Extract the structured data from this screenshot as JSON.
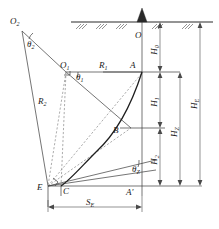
{
  "figure": {
    "type": "geotechnical-slip-surface-diagram",
    "background_color": "#ffffff",
    "line_color": "#3a3a3a",
    "curve_color": "#1f1f1f",
    "dashed_color": "#8a8a8a"
  },
  "points": {
    "O2": "O",
    "O2_sub": "2",
    "O1": "O",
    "O1_sub": "1",
    "O": "O",
    "A": "A",
    "B": "B",
    "E": "E",
    "C": "C",
    "Aprime": "A′"
  },
  "radii": {
    "R1": "R",
    "R1_sub": "1",
    "R2": "R",
    "R2_sub": "2"
  },
  "angles": {
    "theta1": "θ",
    "theta1_sub": "1",
    "theta2": "θ",
    "theta2_sub": "2",
    "thetaZ": "θ",
    "thetaZ_sub": "Z"
  },
  "heights": {
    "H0": "H",
    "H0_sub": "0",
    "H1": "H",
    "H1_sub": "1",
    "H2": "H",
    "H2_sub": "2",
    "HZ": "H",
    "HZ_sub": "Z",
    "HE": "H",
    "HE_sub": "E"
  },
  "spans": {
    "SE": "S",
    "SE_sub": "E"
  }
}
